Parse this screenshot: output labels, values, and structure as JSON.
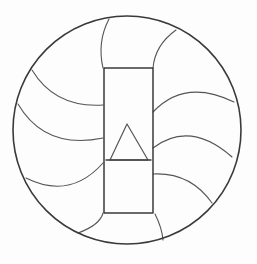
{
  "diagram": {
    "title": "",
    "background": "#fdfdfd",
    "stroke_color": "#3a3a3a",
    "blade_color": "#555555",
    "circle": {
      "cx": 127,
      "cy": 130,
      "r": 114,
      "stroke_width": 1.6
    },
    "rectangle": {
      "x": 104,
      "y": 68,
      "width": 49,
      "height": 145,
      "stroke_width": 1.5
    },
    "triangle": {
      "points": "127,124 110,160 148,160",
      "stroke_width": 1.2
    },
    "base_line": {
      "x1": 106,
      "y1": 160,
      "x2": 151,
      "y2": 160
    },
    "blades": [
      {
        "id": "blade-top-left",
        "d": "M 109 19 Q 97 42 103 68"
      },
      {
        "id": "blade-top-right",
        "d": "M 176 30 Q 155 45 153 68"
      },
      {
        "id": "blade-left-1",
        "d": "M 32 70 Q 55 108 103 105"
      },
      {
        "id": "blade-left-2",
        "d": "M 18 104 Q 45 150 103 138"
      },
      {
        "id": "blade-left-3",
        "d": "M 26 178 Q 70 200 103 163"
      },
      {
        "id": "blade-left-4",
        "d": "M 78 233 Q 100 225 103 213"
      },
      {
        "id": "blade-right-1",
        "d": "M 153 112 Q 185 78 234 102"
      },
      {
        "id": "blade-right-2",
        "d": "M 153 148 Q 190 120 232 157"
      },
      {
        "id": "blade-right-3",
        "d": "M 153 174 Q 190 172 212 203"
      },
      {
        "id": "blade-bottom",
        "d": "M 155 214 Q 162 228 163 240"
      }
    ]
  }
}
